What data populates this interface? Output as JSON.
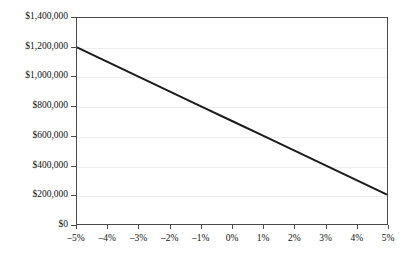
{
  "chart_data": {
    "type": "line",
    "title": "",
    "subtitle": "",
    "xlabel": "",
    "ylabel": "",
    "grid": "horizontal",
    "legend": "none",
    "xlim": [
      -5,
      5
    ],
    "ylim": [
      0,
      1400000
    ],
    "x_tick_labels": [
      "–5%",
      "–4%",
      "–3%",
      "–2%",
      "–1%",
      "0%",
      "1%",
      "2%",
      "3%",
      "4%",
      "5%"
    ],
    "x_tick_values": [
      -5,
      -4,
      -3,
      -2,
      -1,
      0,
      1,
      2,
      3,
      4,
      5
    ],
    "y_tick_labels": [
      "$0",
      "$200,000",
      "$400,000",
      "$600,000",
      "$800,000",
      "$1,000,000",
      "$1,200,000",
      "$1,400,000"
    ],
    "y_tick_values": [
      0,
      200000,
      400000,
      600000,
      800000,
      1000000,
      1200000,
      1400000
    ],
    "series": [
      {
        "name": "value",
        "color": "#1a1a1a",
        "x": [
          -5,
          -4,
          -3,
          -2,
          -1,
          0,
          1,
          2,
          3,
          4,
          5
        ],
        "values": [
          1200000,
          1100000,
          1000000,
          900000,
          800000,
          700000,
          600000,
          500000,
          400000,
          300000,
          200000
        ]
      }
    ],
    "annotations": []
  },
  "style": {
    "line_color": "#1a1a1a",
    "axis_color": "#4a4a4a",
    "grid_color": "#ededed",
    "background": "#ffffff",
    "text_color": "#111111"
  }
}
